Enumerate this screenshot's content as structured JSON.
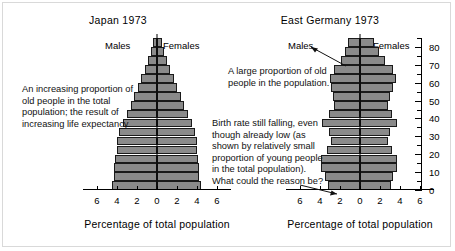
{
  "chart_data": [
    {
      "type": "bar",
      "subtype": "population-pyramid",
      "title": "Japan 1973",
      "xlabel": "Percentage of total population",
      "ylabel": "Age",
      "left_label": "Males",
      "right_label": "Females",
      "xlim": [
        6,
        0,
        6
      ],
      "xticks": [
        6,
        4,
        2,
        0,
        2,
        4,
        6
      ],
      "ylim": [
        0,
        85
      ],
      "yticks": [
        0,
        10,
        20,
        30,
        40,
        50,
        60,
        70,
        80
      ],
      "yminor_step": 5,
      "grid": false,
      "categories": [
        "0-4",
        "5-9",
        "10-14",
        "15-19",
        "20-24",
        "25-29",
        "30-34",
        "35-39",
        "40-44",
        "45-49",
        "50-54",
        "55-59",
        "60-64",
        "65-69",
        "70-74",
        "75-79",
        "80+"
      ],
      "series": [
        {
          "name": "Males",
          "values": [
            4.5,
            4.3,
            4.3,
            4.2,
            4.0,
            4.0,
            3.8,
            3.4,
            3.0,
            2.6,
            2.3,
            1.9,
            1.6,
            1.2,
            0.9,
            0.6,
            0.4
          ]
        },
        {
          "name": "Females",
          "values": [
            4.4,
            4.2,
            4.2,
            4.1,
            4.0,
            4.0,
            3.8,
            3.5,
            3.1,
            2.7,
            2.4,
            2.0,
            1.7,
            1.3,
            1.0,
            0.7,
            0.5
          ]
        }
      ]
    },
    {
      "type": "bar",
      "subtype": "population-pyramid",
      "title": "East Germany 1973",
      "xlabel": "Percentage of total population",
      "ylabel": "Age",
      "left_label": "Males",
      "right_label": "Females",
      "xlim": [
        6,
        0,
        6
      ],
      "xticks": [
        6,
        4,
        2,
        0,
        2,
        4,
        6
      ],
      "ylim": [
        0,
        85
      ],
      "yticks": [
        0,
        10,
        20,
        30,
        40,
        50,
        60,
        70,
        80
      ],
      "yminor_step": 5,
      "grid": false,
      "categories": [
        "0-4",
        "5-9",
        "10-14",
        "15-19",
        "20-24",
        "25-29",
        "30-34",
        "35-39",
        "40-44",
        "45-49",
        "50-54",
        "55-59",
        "60-64",
        "65-69",
        "70-74",
        "75-79",
        "80+"
      ],
      "series": [
        {
          "name": "Males",
          "values": [
            3.2,
            3.5,
            3.9,
            3.9,
            3.3,
            2.9,
            3.1,
            3.8,
            3.1,
            2.6,
            2.7,
            2.9,
            3.0,
            2.6,
            1.9,
            1.5,
            1.2
          ]
        },
        {
          "name": "Females",
          "values": [
            3.1,
            3.3,
            3.7,
            3.7,
            3.2,
            2.8,
            3.0,
            3.7,
            3.2,
            2.8,
            3.0,
            3.3,
            3.6,
            3.3,
            2.5,
            1.9,
            1.4
          ]
        }
      ]
    }
  ],
  "annotations": {
    "japan_old": "An increasing proportion of old people in the total population; the result of increasing life expectancy.",
    "germany_old": "A large proportion of old people in the population.",
    "birth_rate": "Birth rate still falling, even though already low (as shown by relatively small proportion of young people in the total population). What could the reason be?"
  }
}
